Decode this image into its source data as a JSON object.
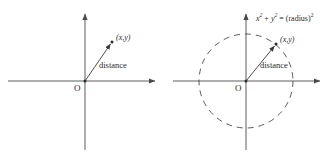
{
  "figure": {
    "background_color": "#ffffff",
    "line_color": "#4a4a4a",
    "text_color": "#2b2b2b"
  },
  "panels": [
    {
      "id": "left",
      "name": "distance-from-origin",
      "origin_label": "O",
      "point_label": "(x,y)",
      "segment_label": "distance",
      "axes": {
        "x_arrow": true,
        "y_arrow": true,
        "origin_px": [
          85,
          81
        ]
      },
      "point_px": [
        112,
        42
      ],
      "circle": null
    },
    {
      "id": "right",
      "name": "circle-equation",
      "origin_label": "O",
      "point_label": "(x,y)",
      "segment_label": "distance",
      "equation": {
        "x_var": "x",
        "x_exp": "2",
        "plus": " + ",
        "y_var": "y",
        "y_exp": "2",
        "equals": " = ",
        "radius_term": "(radius)",
        "radius_exp": "2",
        "full_text": "x2 + y2 = (radius)2"
      },
      "axes": {
        "x_arrow": true,
        "y_arrow": true,
        "origin_px": [
          246,
          81
        ]
      },
      "point_px": [
        276,
        44
      ],
      "circle": {
        "center_px": [
          246,
          81
        ],
        "radius_px": 47,
        "style": "dashed"
      }
    }
  ]
}
